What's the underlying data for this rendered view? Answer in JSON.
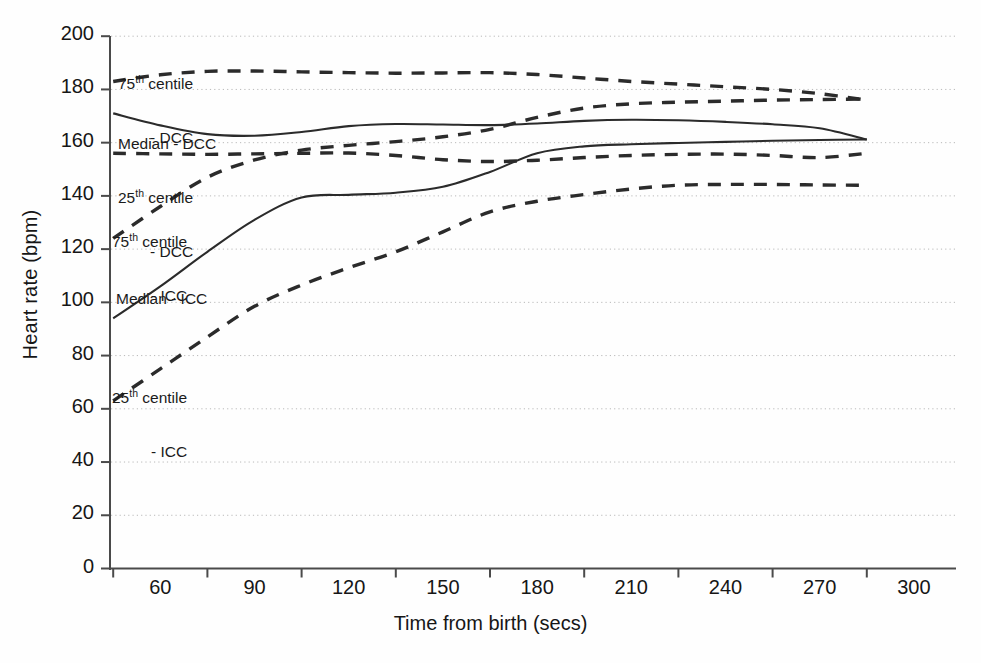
{
  "chart_data": {
    "type": "line",
    "title": "",
    "xlabel": "Time from birth (secs)",
    "ylabel": "Heart rate (bpm)",
    "xlim": [
      45,
      315
    ],
    "ylim": [
      0,
      200
    ],
    "xticks": [
      60,
      90,
      120,
      150,
      180,
      210,
      240,
      270,
      300
    ],
    "xtick_labels": [
      "60",
      "90",
      "120",
      "150",
      "180",
      "210",
      "240",
      "270",
      "300"
    ],
    "yticks": [
      0,
      20,
      40,
      60,
      80,
      100,
      120,
      140,
      160,
      180,
      200
    ],
    "ytick_labels": [
      "0",
      "20",
      "40",
      "60",
      "80",
      "100",
      "120",
      "140",
      "160",
      "180",
      "200"
    ],
    "grid": "horizontal-dotted",
    "legend": "inline-annotations",
    "x": [
      60,
      75,
      90,
      105,
      120,
      135,
      150,
      165,
      180,
      195,
      210,
      225,
      240,
      255,
      270,
      285,
      300
    ],
    "series": [
      {
        "name": "75th centile - DCC",
        "style": "dashed",
        "values": [
          183,
          185.5,
          186.8,
          186.9,
          186.6,
          186.3,
          186.1,
          186.2,
          186.3,
          185.6,
          184.3,
          183.0,
          182.0,
          181.0,
          180.0,
          178.4,
          176.0
        ]
      },
      {
        "name": "Median - DCC",
        "style": "solid",
        "values": [
          171,
          166.5,
          163.2,
          162.6,
          164.0,
          166.2,
          167.0,
          166.8,
          166.6,
          167.2,
          168.2,
          168.6,
          168.4,
          167.8,
          166.9,
          165.4,
          161.2
        ]
      },
      {
        "name": "25th centile - DCC",
        "style": "dashed",
        "values": [
          156,
          155.8,
          155.6,
          155.8,
          156.0,
          156.1,
          155.2,
          153.6,
          152.9,
          153.4,
          154.4,
          155.2,
          155.6,
          155.7,
          155.2,
          154.4,
          156.0
        ]
      },
      {
        "name": "75th centile - ICC",
        "style": "dashed",
        "values": [
          124,
          136,
          147,
          153.5,
          157.2,
          159.0,
          160.4,
          162.2,
          165.0,
          169.5,
          173.0,
          174.6,
          175.2,
          175.6,
          176.0,
          176.2,
          176.4
        ]
      },
      {
        "name": "Median - ICC",
        "style": "solid",
        "values": [
          94,
          106,
          119,
          131,
          139.4,
          140.4,
          141.2,
          143.4,
          149.0,
          156.0,
          158.6,
          159.4,
          159.9,
          160.3,
          160.7,
          161.0,
          161.2
        ]
      },
      {
        "name": "25th centile - ICC",
        "style": "dashed",
        "values": [
          63,
          75,
          87,
          98.5,
          106.5,
          113.0,
          119.0,
          126.5,
          134.0,
          138.0,
          140.5,
          142.6,
          144.0,
          144.3,
          144.3,
          144.1,
          144.0
        ]
      }
    ],
    "annotations": [
      {
        "id": "a75dcc",
        "line1": "75th centile",
        "line2": "- DCC",
        "sup": "th"
      },
      {
        "id": "amddcc",
        "line1": "Median - DCC",
        "line2": "",
        "sup": ""
      },
      {
        "id": "a25dcc",
        "line1": "25th centile",
        "line2": "- DCC",
        "sup": "th"
      },
      {
        "id": "a75icc",
        "line1": "75th centile",
        "line2": "- ICC",
        "sup": "th"
      },
      {
        "id": "amdicc",
        "line1": "Median - ICC",
        "line2": "",
        "sup": ""
      },
      {
        "id": "a25icc",
        "line1": "25th centile",
        "line2": "- ICC",
        "sup": "th"
      }
    ],
    "colors": {
      "line": "#2b2b2b",
      "axis": "#4a4a4a",
      "grid": "#b9b9b9",
      "text": "#161616",
      "background": "#fefefe"
    }
  }
}
